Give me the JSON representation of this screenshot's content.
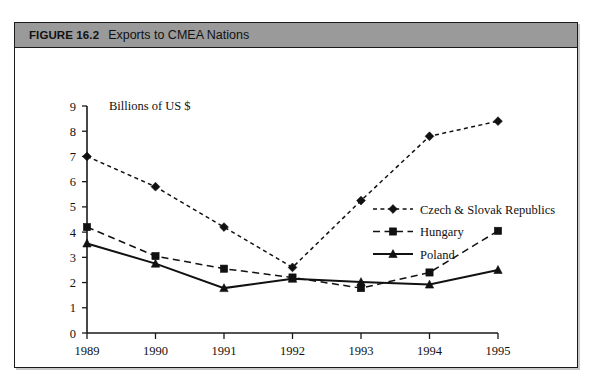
{
  "figure": {
    "number": "FIGURE 16.2",
    "title": "Exports to CMEA Nations",
    "header_bg": "#9a9a9a",
    "frame_border": "#1a1a1a"
  },
  "chart_data": {
    "type": "line",
    "title": "Exports to CMEA Nations",
    "subtitle": "",
    "xlabel": "",
    "ylabel": "Billions of US $",
    "ylabel_position": "top-inside",
    "categories": [
      "1989",
      "1990",
      "1991",
      "1992",
      "1993",
      "1994",
      "1995"
    ],
    "x": [
      1989,
      1990,
      1991,
      1992,
      1993,
      1994,
      1995
    ],
    "ylim": [
      0,
      9
    ],
    "yticks": [
      0,
      1,
      2,
      3,
      4,
      5,
      6,
      7,
      8,
      9
    ],
    "ytick_labels": [
      "0",
      "1",
      "2",
      "3",
      "4",
      "5",
      "6",
      "7",
      "8",
      "9"
    ],
    "grid": false,
    "legend_position": "inside-right",
    "series": [
      {
        "name": "Czech & Slovak Republics",
        "values": [
          7.0,
          5.8,
          4.2,
          2.6,
          5.25,
          7.8,
          8.4
        ],
        "marker": "diamond",
        "linestyle": "dotted",
        "color": "#111111"
      },
      {
        "name": "Hungary",
        "values": [
          4.2,
          3.05,
          2.55,
          2.2,
          1.78,
          2.4,
          4.05
        ],
        "marker": "square",
        "linestyle": "dashed",
        "color": "#111111"
      },
      {
        "name": "Poland",
        "values": [
          3.55,
          2.75,
          1.78,
          2.15,
          2.02,
          1.92,
          2.5
        ],
        "marker": "triangle",
        "linestyle": "solid",
        "color": "#111111"
      }
    ]
  }
}
